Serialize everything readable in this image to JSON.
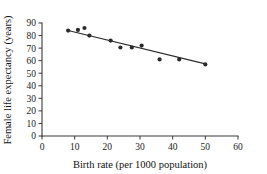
{
  "chart_data": {
    "type": "scatter",
    "title": "",
    "xlabel": "Birth rate (per 1000 population)",
    "ylabel": "Female life expectancy (years)",
    "xlim": [
      0,
      60
    ],
    "ylim": [
      0,
      90
    ],
    "xticks": [
      0,
      10,
      20,
      30,
      40,
      50,
      60
    ],
    "yticks": [
      0,
      10,
      20,
      30,
      40,
      50,
      60,
      70,
      80,
      90
    ],
    "grid": false,
    "legend": false,
    "legend_position": "none",
    "marker": "filled-circle",
    "marker_color": "#2b2b2b",
    "points": [
      {
        "x": 8.0,
        "y": 84.0
      },
      {
        "x": 11.0,
        "y": 84.5
      },
      {
        "x": 13.0,
        "y": 86.0
      },
      {
        "x": 14.5,
        "y": 80.0
      },
      {
        "x": 21.0,
        "y": 76.0
      },
      {
        "x": 24.0,
        "y": 70.5
      },
      {
        "x": 27.5,
        "y": 70.5
      },
      {
        "x": 30.5,
        "y": 72.0
      },
      {
        "x": 36.0,
        "y": 61.0
      },
      {
        "x": 42.0,
        "y": 61.0
      },
      {
        "x": 50.0,
        "y": 57.0
      }
    ],
    "trend_line": {
      "type": "linear-fit",
      "x_start": 8.0,
      "y_start": 84.0,
      "x_end": 50.0,
      "y_end": 57.5,
      "color": "#2b2b2b"
    }
  },
  "axes": {
    "x_title": "Birth rate (per 1000 population)",
    "y_title": "Female life expectancy (years)",
    "x_tick_labels": [
      "0",
      "10",
      "20",
      "30",
      "40",
      "50",
      "60"
    ],
    "y_tick_labels": [
      "0",
      "10",
      "20",
      "30",
      "40",
      "50",
      "60",
      "70",
      "80",
      "90"
    ]
  }
}
